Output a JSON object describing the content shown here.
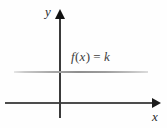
{
  "figure": {
    "background_color": "#fefefe"
  },
  "axes": {
    "x_label": "x",
    "y_label": "y",
    "x_axis_color": "#4d4d4d",
    "y_axis_color": "#3a3a3a",
    "arrow_color": "#111111"
  },
  "function": {
    "label_f": "f",
    "label_open_paren": "(",
    "label_variable": "x",
    "label_close_paren": ")",
    "label_equals": "=",
    "label_constant": "k",
    "full_label": "f(x) = k",
    "line_color": "#8f8f8f"
  },
  "chart_data": {
    "type": "line",
    "title": "",
    "xlabel": "x",
    "ylabel": "y",
    "grid": false,
    "legend": false,
    "annotations": [
      {
        "text": "f(x) = k",
        "x": 0.25,
        "y": 1.35
      }
    ],
    "series": [
      {
        "name": "f(x) = k",
        "x": [
          -2.3,
          3.0
        ],
        "values": [
          1.0,
          1.0
        ],
        "constant_value": 1.0,
        "color": "#8f8f8f"
      }
    ],
    "xlim": [
      -2.45,
      3.3
    ],
    "ylim": [
      -0.4,
      2.4
    ]
  }
}
